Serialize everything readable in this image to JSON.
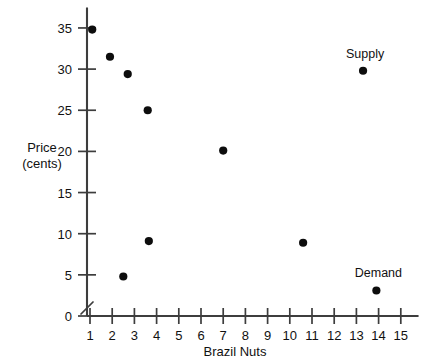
{
  "chart_data": {
    "type": "scatter",
    "title": "",
    "xlabel": "Brazil Nuts",
    "ylabel": "Price (cents)",
    "ylabel_line1": "Price",
    "ylabel_line2": "(cents)",
    "xlim": [
      0,
      15.8
    ],
    "ylim": [
      0,
      37.5
    ],
    "xticks": [
      1,
      2,
      3,
      4,
      5,
      6,
      7,
      8,
      9,
      10,
      11,
      12,
      13,
      14,
      15
    ],
    "yticks": [
      0,
      5,
      10,
      15,
      20,
      25,
      30,
      35
    ],
    "xtick_labels": [
      "1",
      "2",
      "3",
      "4",
      "5",
      "6",
      "7",
      "8",
      "9",
      "10",
      "11",
      "12",
      "13",
      "14",
      "15"
    ],
    "ytick_labels": [
      "0",
      "5",
      "10",
      "15",
      "20",
      "25",
      "30",
      "35"
    ],
    "grid": false,
    "legend": "none",
    "axis_break": true,
    "points": [
      {
        "x": 1.1,
        "y": 34.8,
        "label": ""
      },
      {
        "x": 1.9,
        "y": 31.5,
        "label": ""
      },
      {
        "x": 2.7,
        "y": 29.4,
        "label": ""
      },
      {
        "x": 3.6,
        "y": 25.0,
        "label": ""
      },
      {
        "x": 3.65,
        "y": 9.1,
        "label": ""
      },
      {
        "x": 2.5,
        "y": 4.8,
        "label": ""
      },
      {
        "x": 7.0,
        "y": 20.1,
        "label": ""
      },
      {
        "x": 10.6,
        "y": 8.9,
        "label": ""
      },
      {
        "x": 13.3,
        "y": 29.8,
        "label": "Supply"
      },
      {
        "x": 13.9,
        "y": 3.1,
        "label": "Demand"
      }
    ],
    "annotations": [
      {
        "text": "Supply",
        "x": 13.3,
        "y": 29.8
      },
      {
        "text": "Demand",
        "x": 13.9,
        "y": 3.1
      }
    ],
    "colors": {
      "marker": "#0d0d0d",
      "axis": "#3d3d3d",
      "text": "#111111",
      "background": "#ffffff"
    }
  }
}
